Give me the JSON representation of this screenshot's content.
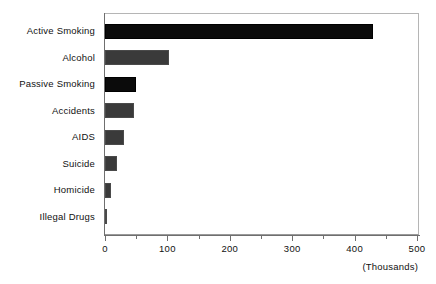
{
  "chart_data": {
    "type": "bar",
    "orientation": "horizontal",
    "title": "",
    "subtitle": "",
    "xlabel": "(Thousands)",
    "ylabel": "",
    "categories": [
      "Active Smoking",
      "Alcohol",
      "Passive Smoking",
      "Accidents",
      "AIDS",
      "Suicide",
      "Homicide",
      "Illegal Drugs"
    ],
    "values": [
      430,
      103,
      50,
      47,
      30,
      19,
      10,
      4
    ],
    "bar_fills": [
      "solid-black",
      "dither-gray",
      "solid-black",
      "dither-gray",
      "dither-gray",
      "dither-gray",
      "dither-gray",
      "dither-gray"
    ],
    "xlim": [
      0,
      500
    ],
    "x_major_ticks": [
      0,
      100,
      200,
      300,
      400,
      500
    ],
    "x_minor_ticks": [
      50,
      150,
      250,
      350,
      450
    ],
    "x_tick_labels": [
      "0",
      "100",
      "200",
      "300",
      "400",
      "500"
    ],
    "grid": false,
    "legend": false,
    "units_note": "(Thousands)",
    "colors": {
      "solid_bar": "#0b0b0b",
      "dither_bar": "#9b9b9b",
      "axis": "#6f6f6f",
      "frame": "#b5b5b5",
      "text": "#111111",
      "background": "#ffffff"
    }
  }
}
